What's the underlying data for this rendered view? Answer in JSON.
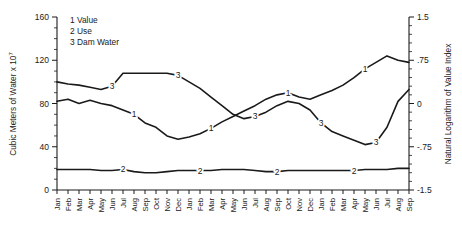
{
  "chart_data": {
    "type": "line",
    "title": "",
    "xlabel": "",
    "ylabel": "Cubic Meters of Water x 10",
    "ylabel_exponent": "7",
    "y2label": "Natural Logarithm of Value Index",
    "grid": false,
    "legend_position": "top-left",
    "ylim": [
      0,
      160
    ],
    "y2lim": [
      -1.5,
      1.5
    ],
    "yticks": [
      "0",
      "40",
      "80",
      "120",
      "160"
    ],
    "ytick_values": [
      0,
      40,
      80,
      120,
      160
    ],
    "y2ticks": [
      "-1.5",
      "-.75",
      "0",
      ".75",
      "1.5"
    ],
    "y2tick_values": [
      -1.5,
      -0.75,
      0,
      0.75,
      1.5
    ],
    "categories": [
      "Jan",
      "Feb",
      "Mar",
      "Apr",
      "May",
      "Jun",
      "Jul",
      "Aug",
      "Sep",
      "Oct",
      "Nov",
      "Dec",
      "Jan",
      "Feb",
      "Mar",
      "Apr",
      "May",
      "Jun",
      "Jul",
      "Aug",
      "Sep",
      "Oct",
      "Nov",
      "Dec",
      "Jan",
      "Feb",
      "Mar",
      "Apr",
      "May",
      "Jun",
      "Jul",
      "Aug",
      "Sep"
    ],
    "legend": [
      {
        "key": "1",
        "label": "Value"
      },
      {
        "key": "2",
        "label": "Use"
      },
      {
        "key": "3",
        "label": "Dam Water"
      }
    ],
    "series": [
      {
        "name": "Value",
        "key": "1",
        "values": [
          82,
          84,
          80,
          83,
          80,
          78,
          74,
          70,
          62,
          58,
          50,
          47,
          49,
          52,
          57,
          63,
          68,
          73,
          78,
          84,
          88,
          90,
          86,
          84,
          88,
          92,
          97,
          104,
          112,
          118,
          124,
          120,
          118
        ],
        "label_positions": [
          7,
          14,
          21,
          28
        ]
      },
      {
        "name": "Use",
        "key": "2",
        "values": [
          19,
          19,
          19,
          19,
          18,
          18,
          19,
          17,
          16,
          16,
          17,
          18,
          18,
          18,
          18,
          19,
          19,
          19,
          18,
          17,
          17,
          18,
          18,
          18,
          18,
          18,
          18,
          18,
          19,
          19,
          19,
          20,
          20
        ],
        "label_positions": [
          6,
          13,
          20,
          27
        ]
      },
      {
        "name": "Dam Water",
        "key": "3",
        "values": [
          100,
          98,
          97,
          95,
          93,
          96,
          108,
          108,
          108,
          108,
          108,
          106,
          100,
          94,
          86,
          78,
          70,
          66,
          68,
          72,
          78,
          82,
          80,
          74,
          62,
          54,
          50,
          46,
          42,
          44,
          58,
          82,
          93
        ],
        "label_positions": [
          5,
          11,
          18,
          24,
          29
        ]
      }
    ],
    "annotations": []
  },
  "legend_block": {
    "line1": "1 Value",
    "line2": "2 Use",
    "line3": "3 Dam Water"
  }
}
